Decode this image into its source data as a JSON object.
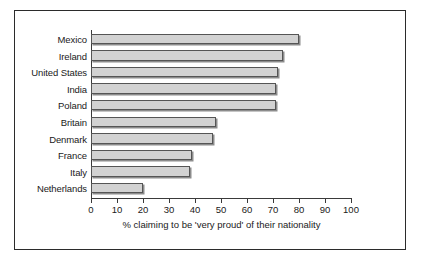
{
  "chart_data": {
    "type": "bar",
    "orientation": "horizontal",
    "title": "",
    "xlabel": "% claiming to be 'very proud' of their nationality",
    "ylabel": "",
    "xlim": [
      0,
      100
    ],
    "xticks": [
      0,
      10,
      20,
      30,
      40,
      50,
      60,
      70,
      80,
      90,
      100
    ],
    "xtick_labels": [
      "0",
      "10",
      "20",
      "30",
      "40",
      "50",
      "60",
      "70",
      "80",
      "90",
      "100"
    ],
    "grid": false,
    "legend": false,
    "categories": [
      "Mexico",
      "Ireland",
      "United States",
      "India",
      "Poland",
      "Britain",
      "Denmark",
      "France",
      "Italy",
      "Netherlands"
    ],
    "values": [
      80,
      74,
      72,
      71,
      71,
      48,
      47,
      39,
      38,
      20
    ],
    "bar_fill_color": "#d2d2d2",
    "bar_border_color": "#555555",
    "bar_shadow_color": "#8c8c8c",
    "axis_color": "#3a3a3a",
    "frame_color": "#2b2b2b",
    "background_color": "#ffffff",
    "text_color": "#1a1a1a"
  }
}
